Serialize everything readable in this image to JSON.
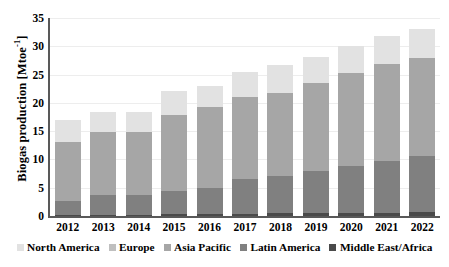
{
  "chart_data": {
    "type": "bar",
    "stacked": true,
    "title": "",
    "xlabel": "",
    "ylabel": "Biogas production [Mtoe-1]",
    "ylabel_base": "Biogas production [Mtoe",
    "ylabel_sup": "-1",
    "ylabel_tail": "]",
    "ylim": [
      0,
      35
    ],
    "ytick_step": 5,
    "yticks": [
      "0",
      "5",
      "10",
      "15",
      "20",
      "25",
      "30",
      "35"
    ],
    "grid": true,
    "legend_position": "bottom",
    "categories": [
      "2012",
      "2013",
      "2014",
      "2015",
      "2016",
      "2017",
      "2018",
      "2019",
      "2020",
      "2021",
      "2022"
    ],
    "series": [
      {
        "name": "Middle East/Africa",
        "color": "#4a4a4a",
        "values": [
          0.2,
          0.2,
          0.2,
          0.3,
          0.3,
          0.4,
          0.5,
          0.5,
          0.6,
          0.6,
          0.7
        ]
      },
      {
        "name": "Latin America",
        "color": "#808080",
        "values": [
          2.5,
          3.6,
          3.6,
          4.2,
          4.6,
          6.1,
          6.5,
          7.5,
          8.3,
          9.2,
          9.9
        ]
      },
      {
        "name": "Asia Pacific",
        "color": "#a6a6a6",
        "values": [
          10.4,
          11.1,
          11.1,
          13.3,
          14.4,
          14.5,
          14.8,
          15.6,
          16.3,
          17.0,
          17.3
        ]
      },
      {
        "name": "Europe",
        "color": "#bfbfbf",
        "values": [
          0.0,
          0.0,
          0.0,
          0.0,
          0.0,
          0.0,
          0.0,
          0.0,
          0.0,
          0.0,
          0.0
        ]
      },
      {
        "name": "North America",
        "color": "#e2e2e2",
        "values": [
          3.8,
          3.5,
          3.5,
          4.3,
          3.6,
          4.4,
          4.9,
          4.5,
          4.9,
          5.1,
          5.2
        ]
      }
    ],
    "totals": [
      16.9,
      18.4,
      18.4,
      22.1,
      22.9,
      25.4,
      26.7,
      28.1,
      30.1,
      31.9,
      33.1
    ]
  },
  "legend": {
    "items": [
      {
        "label": "North America",
        "color": "#e2e2e2"
      },
      {
        "label": "Europe",
        "color": "#bfbfbf"
      },
      {
        "label": "Asia Pacific",
        "color": "#a6a6a6"
      },
      {
        "label": "Latin America",
        "color": "#808080"
      },
      {
        "label": "Middle East/Africa",
        "color": "#4a4a4a"
      }
    ]
  },
  "colors": {
    "axis": "#595959",
    "grid": "#ededed",
    "background": "#ffffff",
    "text": "#000000"
  }
}
